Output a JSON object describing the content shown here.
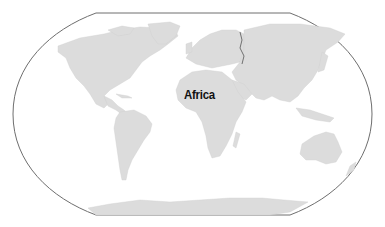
{
  "map": {
    "projection": "Robinson-style world map",
    "highlighted_label": "Africa",
    "colors": {
      "land": "#dcdcdc",
      "ocean": "#ffffff",
      "frame": "#6e6e6e",
      "label": "#111111"
    },
    "labels": [
      {
        "text": "Africa",
        "x": 184,
        "y": 87
      }
    ]
  }
}
